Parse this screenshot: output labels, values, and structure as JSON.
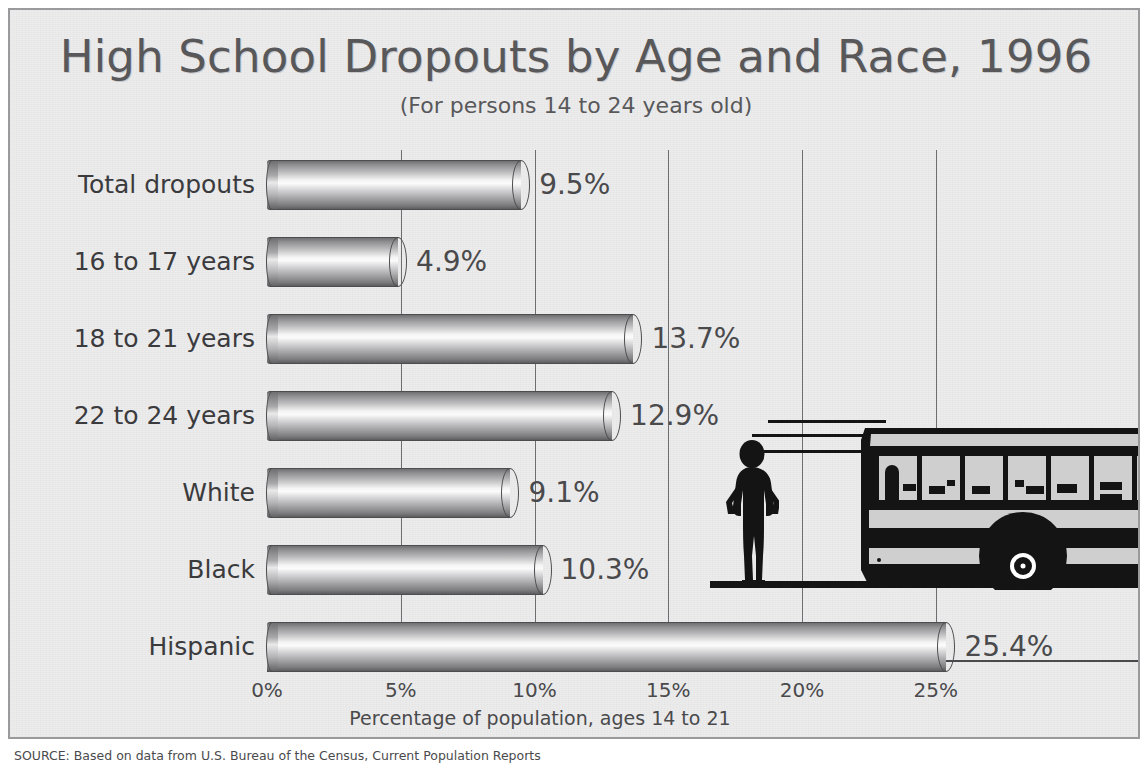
{
  "chart_data": {
    "type": "bar",
    "orientation": "horizontal",
    "title": "High School Dropouts by Age and Race, 1996",
    "subtitle": "(For persons 14 to 24 years old)",
    "xlabel": "Percentage of population, ages 14 to 21",
    "ylabel": "",
    "xlim": [
      0,
      26.5
    ],
    "xticks": [
      "0%",
      "5%",
      "10%",
      "15%",
      "20%",
      "25%"
    ],
    "xtick_values": [
      0,
      5,
      10,
      15,
      20,
      25
    ],
    "grid": "vertical",
    "legend": "none",
    "categories": [
      "Total dropouts",
      "16 to 17 years",
      "18 to 21 years",
      "22 to 24 years",
      "White",
      "Black",
      "Hispanic"
    ],
    "values": [
      9.5,
      4.9,
      13.7,
      12.9,
      9.1,
      10.3,
      25.4
    ],
    "value_labels": [
      "9.5%",
      "4.9%",
      "13.7%",
      "12.9%",
      "9.1%",
      "10.3%",
      "25.4%"
    ],
    "source": "SOURCE: Based on data from U.S. Bureau of the Census, Current Population Reports",
    "colors": {
      "background": "#ececed",
      "bar_light": "#fbfbfb",
      "bar_dark": "#5d5d5f",
      "text": "#4a4a4c",
      "gridline": "#6e6e70",
      "silhouette": "#141414"
    },
    "decorations": [
      "person-silhouette",
      "school-bus-silhouette",
      "speed-lines",
      "ground-line"
    ]
  }
}
